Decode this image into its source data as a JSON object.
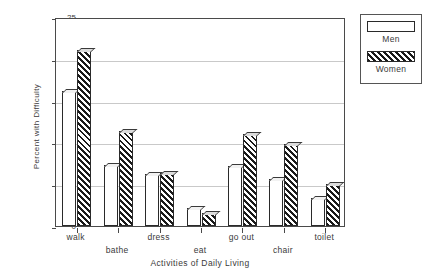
{
  "chart_data": {
    "type": "bar",
    "title": "",
    "xlabel": "Activities of Daily Living",
    "ylabel": "Percent with Difficulty",
    "categories": [
      "walk",
      "bathe",
      "dress",
      "eat",
      "go out",
      "chair",
      "toilet"
    ],
    "series": [
      {
        "name": "Men",
        "values": [
          16.2,
          7.3,
          6.2,
          2.1,
          7.2,
          5.6,
          3.4
        ]
      },
      {
        "name": "Women",
        "values": [
          21.1,
          11.4,
          6.4,
          1.6,
          11.0,
          9.8,
          5.0
        ]
      }
    ],
    "ylim": [
      0,
      25
    ],
    "yticks": [
      0,
      5,
      10,
      15,
      20,
      25
    ],
    "ytick_labels": [
      "0",
      "5",
      "10",
      "15",
      "20",
      "25"
    ],
    "grid": true,
    "legend_position": "right-outside",
    "legend_entries": [
      {
        "label": "Men",
        "pattern": "solid-white"
      },
      {
        "label": "Women",
        "pattern": "diagonal-hatch"
      }
    ]
  }
}
